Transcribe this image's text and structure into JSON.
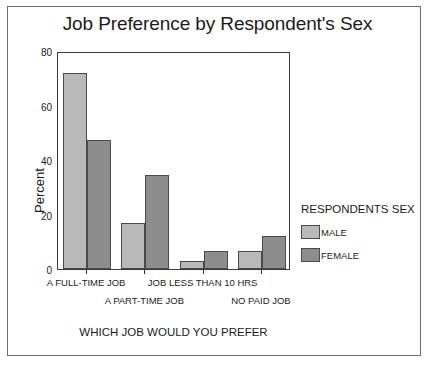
{
  "chart_data": {
    "type": "bar",
    "title": "Job Preference by Respondent's Sex",
    "xlabel": "WHICH JOB WOULD YOU PREFER",
    "ylabel": "Percent",
    "categories": [
      "A FULL-TIME JOB",
      "A PART-TIME JOB",
      "JOB LESS THAN 10 HRS",
      "NO PAID JOB"
    ],
    "series": [
      {
        "name": "MALE",
        "color": "#b9b9b9",
        "values": [
          72,
          17,
          3,
          6.5
        ]
      },
      {
        "name": "FEMALE",
        "color": "#8d8d8d",
        "values": [
          47.5,
          34.5,
          6.5,
          12
        ]
      }
    ],
    "ylim": [
      0,
      80
    ],
    "yticks": [
      0,
      20,
      40,
      60,
      80
    ],
    "ytick_labels": [
      "0",
      "20",
      "40",
      "60",
      "80"
    ],
    "grid": false,
    "legend_title": "RESPONDENTS SEX",
    "legend_position": "right"
  },
  "figure": {
    "border_color": "#6e6e6e",
    "axis_color": "#3a3a3a",
    "background": "#ffffff"
  }
}
